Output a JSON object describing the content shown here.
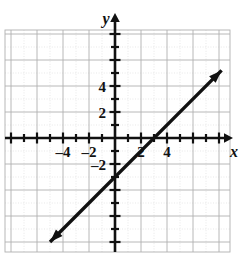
{
  "figure": {
    "kind": "coordinate-plane-graph",
    "partial_title_top": "g  y",
    "background_color": "#ffffff",
    "ink_color": "#111111",
    "grid_color": "#b9b9b9",
    "minor_grid_color": "#d6d6d6"
  },
  "axes": {
    "x_axis_label": "x",
    "y_axis_label": "y",
    "x_ticks": [
      {
        "value": -4,
        "label": "–4"
      },
      {
        "value": -2,
        "label": "–2"
      },
      {
        "value": 2,
        "label": "2"
      },
      {
        "value": 4,
        "label": "4"
      }
    ],
    "y_ticks": [
      {
        "value": 4,
        "label": "4"
      },
      {
        "value": 2,
        "label": "2"
      },
      {
        "value": -2,
        "label": "–2"
      }
    ],
    "x_range": [
      -8.4,
      8.8
    ],
    "y_range": [
      -8.8,
      8.3
    ],
    "tick_interval": 1,
    "grid_interval": 2,
    "grid_visible": true,
    "arrowheads": [
      "x-positive",
      "y-positive"
    ]
  },
  "chart_data": {
    "type": "line",
    "title": "",
    "subtitle": "",
    "xlabel": "x",
    "ylabel": "y",
    "xlim": [
      -8.4,
      8.8
    ],
    "ylim": [
      -8.8,
      8.3
    ],
    "grid": true,
    "legend_position": "none",
    "series": [
      {
        "name": "line",
        "equation": "y = x - 3",
        "slope": 1,
        "y_intercept": -3,
        "x_intercept": 3,
        "style": "solid-double-arrow",
        "x": [
          -5.0,
          8.2
        ],
        "y": [
          -8.0,
          5.2
        ],
        "points": [
          {
            "x": 0,
            "y": -3,
            "note": "y-intercept"
          },
          {
            "x": 3,
            "y": 0,
            "note": "x-intercept"
          }
        ]
      }
    ],
    "annotations": []
  },
  "geometry": {
    "origin_px": {
      "x": 115,
      "y": 138
    },
    "unit_px": 13,
    "grid_box_px": {
      "left": 5,
      "top": 30,
      "right": 230,
      "bottom": 252
    }
  }
}
